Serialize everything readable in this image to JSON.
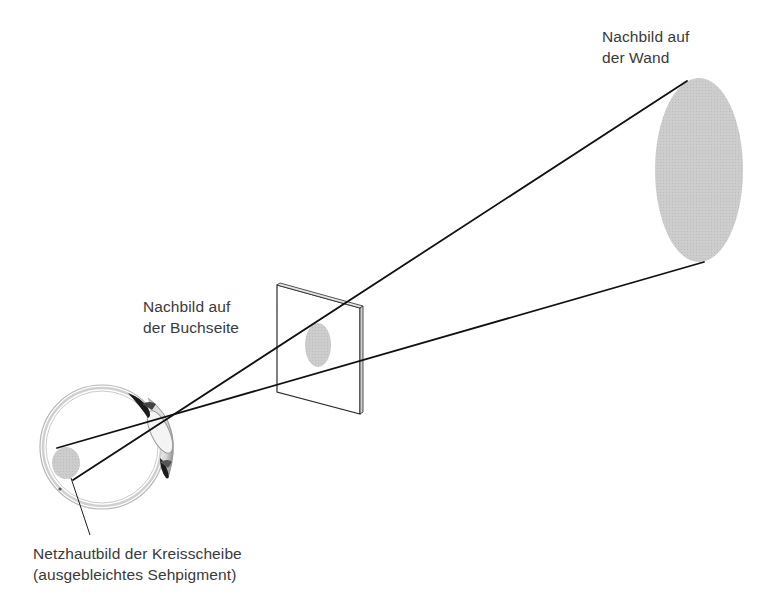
{
  "diagram": {
    "labels": {
      "wall": {
        "line1": "Nachbild auf",
        "line2": "der Wand"
      },
      "page": {
        "line1": "Nachbild auf",
        "line2": "der Buchseite"
      },
      "retina": {
        "line1": "Netzhautbild der Kreisscheibe",
        "line2": "(ausgebleichtes Sehpigment)"
      }
    },
    "elements": [
      {
        "name": "eye",
        "icon": "eye-cross-section-icon"
      },
      {
        "name": "retinal-image",
        "icon": "ellipse-icon"
      },
      {
        "name": "book-page",
        "icon": "page-icon"
      },
      {
        "name": "page-afterimage",
        "icon": "ellipse-icon"
      },
      {
        "name": "wall-afterimage",
        "icon": "ellipse-icon"
      },
      {
        "name": "projection-rays",
        "icon": "line-icon"
      }
    ],
    "colors": {
      "background": "#ffffff",
      "ink": "#111111",
      "afterimage_fill": "#c8c8c8",
      "text": "#3a3a3a"
    }
  }
}
